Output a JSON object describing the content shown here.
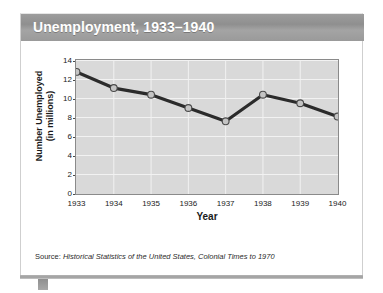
{
  "title": "Unemployment, 1933–1940",
  "source": {
    "label": "Source: ",
    "citation": "Historical Statistics of the United States, Colonial Times to 1970"
  },
  "colors": {
    "title_bar": "#9a9a9a",
    "title_text": "#ffffff",
    "plot_background": "#d9d9d9",
    "gridline": "#f2f2f2",
    "axis": "#8a8a8a",
    "series_line": "#2b2b2b",
    "marker_fill": "#c4c4c4",
    "marker_stroke": "#4a4a4a"
  },
  "chart_data": {
    "type": "line",
    "title": "Unemployment, 1933–1940",
    "xlabel": "Year",
    "ylabel": "Number Unemployed (in millions)",
    "ylabel_line1": "Number Unemployed",
    "ylabel_line2": "(in millions)",
    "categories": [
      "1933",
      "1934",
      "1935",
      "1936",
      "1937",
      "1938",
      "1939",
      "1940"
    ],
    "values": [
      12.8,
      11.1,
      10.4,
      9.0,
      7.6,
      10.4,
      9.5,
      8.1
    ],
    "x": [
      1933,
      1934,
      1935,
      1936,
      1937,
      1938,
      1939,
      1940
    ],
    "ylim": [
      0,
      14
    ],
    "ytick_values": [
      0,
      2,
      4,
      6,
      8,
      10,
      12,
      14
    ],
    "ytick_labels": [
      "0",
      "2",
      "4",
      "6",
      "8",
      "10",
      "12",
      "14"
    ],
    "xtick_labels": [
      "1933",
      "1934",
      "1935",
      "1936",
      "1937",
      "1938",
      "1939",
      "1940"
    ],
    "grid": true,
    "legend": "none",
    "markers": "circle"
  }
}
